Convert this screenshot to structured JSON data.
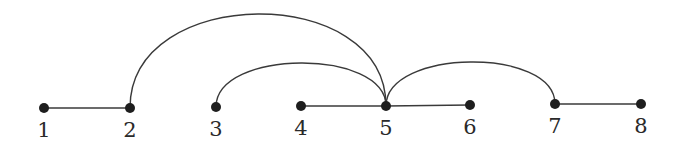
{
  "diagram": {
    "type": "graph",
    "nodes": [
      {
        "id": 1,
        "label": "1",
        "x": 44,
        "y": 108
      },
      {
        "id": 2,
        "label": "2",
        "x": 130,
        "y": 108
      },
      {
        "id": 3,
        "label": "3",
        "x": 216,
        "y": 107
      },
      {
        "id": 4,
        "label": "4",
        "x": 301,
        "y": 106
      },
      {
        "id": 5,
        "label": "5",
        "x": 386,
        "y": 106
      },
      {
        "id": 6,
        "label": "6",
        "x": 470,
        "y": 105
      },
      {
        "id": 7,
        "label": "7",
        "x": 555,
        "y": 104
      },
      {
        "id": 8,
        "label": "8",
        "x": 641,
        "y": 104
      }
    ],
    "edges": [
      {
        "from": 1,
        "to": 2,
        "style": "straight"
      },
      {
        "from": 4,
        "to": 5,
        "style": "straight"
      },
      {
        "from": 5,
        "to": 6,
        "style": "straight"
      },
      {
        "from": 7,
        "to": 8,
        "style": "straight"
      },
      {
        "from": 2,
        "to": 5,
        "style": "arc",
        "peak_y": 14
      },
      {
        "from": 3,
        "to": 5,
        "style": "arc",
        "peak_y": 63
      },
      {
        "from": 5,
        "to": 7,
        "style": "arc",
        "peak_y": 62
      }
    ],
    "colors": {
      "edge": "#3a3a3a",
      "node": "#1e1e1e",
      "label": "#2a2a2a",
      "background": "#ffffff"
    }
  }
}
